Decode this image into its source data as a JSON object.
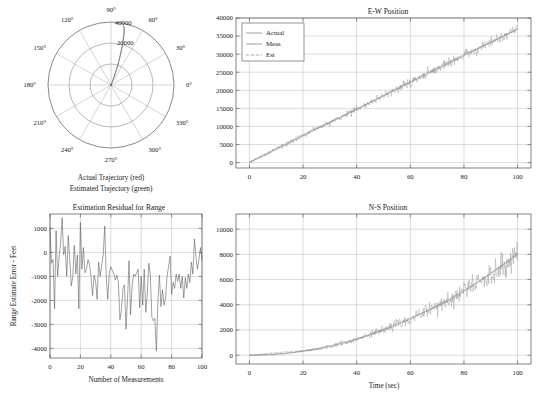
{
  "figure": {
    "background": "#ffffff",
    "axis_color": "#4d4d4d",
    "grid_color": "#b9b9b9"
  },
  "chart_data": [
    {
      "id": "polar-trajectory",
      "type": "line",
      "projection": "polar",
      "title": "",
      "caption_lines": [
        "Actual Trajectory (red)",
        "Estimated Trajectory (green)"
      ],
      "angle_ticks": [
        "0°",
        "30°",
        "60°",
        "90°",
        "120°",
        "150°",
        "180°",
        "210°",
        "240°",
        "270°",
        "300°",
        "330°"
      ],
      "radial_ticks": [
        "20000",
        "40000"
      ],
      "rlim": [
        0,
        40000
      ],
      "grid": true,
      "series": [
        {
          "name": "Actual Trajectory",
          "color": "#d02020",
          "theta_deg": [
            68,
            68.5,
            69,
            69.5,
            70,
            70.5,
            71,
            71.5,
            72,
            72.5,
            73,
            73.5,
            74,
            74.5,
            75,
            75.5,
            76,
            76.5,
            77,
            77.5,
            78
          ],
          "r": [
            0,
            2000,
            4000,
            6000,
            8000,
            10500,
            13000,
            15500,
            18000,
            20500,
            23000,
            25500,
            27500,
            29500,
            31500,
            33500,
            35000,
            36200,
            37200,
            38000,
            38600
          ]
        },
        {
          "name": "Estimated Trajectory",
          "color": "#20a020",
          "theta_deg": [
            67.5,
            68,
            68.8,
            69.4,
            70.1,
            70.7,
            71.3,
            71.8,
            72.4,
            73,
            73.6,
            74.1,
            74.6,
            75.1,
            75.6,
            76.1,
            76.6,
            77,
            77.4,
            77.8,
            78.2
          ],
          "r": [
            300,
            2200,
            4100,
            6200,
            8300,
            10600,
            13100,
            15600,
            18100,
            20600,
            23100,
            25600,
            27600,
            29600,
            31600,
            33600,
            35100,
            36300,
            37300,
            38100,
            38700
          ]
        }
      ]
    },
    {
      "id": "ew-position",
      "type": "line",
      "title": "E-W Position",
      "xlabel": "",
      "ylabel": "",
      "xlim": [
        -5,
        105
      ],
      "ylim": [
        -1500,
        40000
      ],
      "xticks": [
        0,
        20,
        40,
        60,
        80,
        100
      ],
      "yticks": [
        0,
        5000,
        10000,
        15000,
        20000,
        25000,
        30000,
        35000,
        40000
      ],
      "grid": true,
      "legend": {
        "position": "upper-left",
        "entries": [
          {
            "label": "Actual",
            "style": "solid",
            "color": "#6e6e6e"
          },
          {
            "label": "Meas",
            "style": "solid",
            "color": "#9d9d9d"
          },
          {
            "label": "Est",
            "style": "dashdot",
            "color": "#7d7d7d"
          }
        ]
      },
      "series": [
        {
          "name": "Actual",
          "description": "linear ramp from 0 at t=0 to about 37000 at t=100"
        },
        {
          "name": "Meas",
          "description": "noisy measurement scattered about the actual ramp, noise amplitude growing from about 300 to about 1400 feet"
        },
        {
          "name": "Est",
          "description": "Kalman estimate closely tracking the actual ramp"
        }
      ]
    },
    {
      "id": "estimation-residual",
      "type": "line",
      "title": "Estimation Residual for Range",
      "xlabel": "Number of Measurements",
      "ylabel": "Range Estimate Error - Feet",
      "xlim": [
        0,
        100
      ],
      "ylim": [
        -4400,
        1600
      ],
      "xticks": [
        0,
        20,
        40,
        60,
        80,
        100
      ],
      "yticks": [
        -4000,
        -3000,
        -2000,
        -1000,
        0,
        1000
      ],
      "grid": true,
      "series": [
        {
          "name": "Range estimate error",
          "color": "#555555",
          "x": [
            0,
            1,
            2,
            3,
            4,
            5,
            6,
            7,
            8,
            9,
            10,
            11,
            12,
            13,
            14,
            15,
            16,
            17,
            18,
            19,
            20,
            21,
            22,
            23,
            24,
            25,
            26,
            27,
            28,
            29,
            30,
            31,
            32,
            33,
            34,
            35,
            36,
            37,
            38,
            39,
            40,
            41,
            42,
            43,
            44,
            45,
            46,
            47,
            48,
            49,
            50,
            51,
            52,
            53,
            54,
            55,
            56,
            57,
            58,
            59,
            60,
            61,
            62,
            63,
            64,
            65,
            66,
            67,
            68,
            69,
            70,
            71,
            72,
            73,
            74,
            75,
            76,
            77,
            78,
            79,
            80,
            81,
            82,
            83,
            84,
            85,
            86,
            87,
            88,
            89,
            90,
            91,
            92,
            93,
            94,
            95,
            96,
            97,
            98,
            99,
            100
          ],
          "y": [
            1050,
            -450,
            -300,
            -2350,
            900,
            -1000,
            -200,
            400,
            1450,
            -100,
            250,
            -1000,
            700,
            -300,
            -1400,
            -1000,
            300,
            -900,
            -100,
            -2350,
            1250,
            -700,
            200,
            -850,
            -700,
            -300,
            -500,
            -1050,
            -1800,
            -950,
            -1200,
            -1950,
            -400,
            -1000,
            -550,
            -100,
            1100,
            -1000,
            -1950,
            -850,
            -600,
            -750,
            -900,
            -1150,
            -950,
            -1250,
            -2800,
            -2400,
            -1500,
            -1350,
            -3200,
            -1950,
            -350,
            -2600,
            -1400,
            -900,
            -1000,
            -850,
            -700,
            -2300,
            -1000,
            -2200,
            -700,
            -2500,
            -1750,
            -450,
            -900,
            -2700,
            -2850,
            -2750,
            -4100,
            -2000,
            -950,
            -2250,
            -1550,
            -2200,
            -1900,
            -1000,
            -600,
            -150,
            -1750,
            -1250,
            -1500,
            -900,
            -1200,
            -900,
            -1500,
            -1000,
            -1900,
            -1050,
            -1500,
            -900,
            -1250,
            -400,
            -900,
            560,
            -150,
            -700,
            -300,
            200,
            -350
          ]
        }
      ]
    },
    {
      "id": "ns-position",
      "type": "line",
      "title": "N-S Position",
      "xlabel": "Time (sec)",
      "ylabel": "",
      "xlim": [
        -5,
        105
      ],
      "ylim": [
        -700,
        11200
      ],
      "xticks": [
        0,
        20,
        40,
        60,
        80,
        100
      ],
      "yticks": [
        0,
        2000,
        4000,
        6000,
        8000,
        10000
      ],
      "grid": true,
      "series": [
        {
          "name": "Actual",
          "description": "quadratic rise from 0 at t=0 to about 8000 at t=100"
        },
        {
          "name": "Meas",
          "description": "noisy measurement scattered about the quadratic curve, noise amplitude growing to about 1800 feet"
        },
        {
          "name": "Est",
          "description": "Kalman estimate closely tracking the actual quadratic curve"
        }
      ]
    }
  ]
}
